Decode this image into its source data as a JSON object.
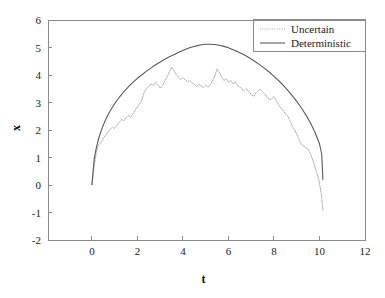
{
  "chart_data": {
    "type": "line",
    "title": "",
    "xlabel": "t",
    "ylabel": "x",
    "xlim": [
      -1.93,
      12
    ],
    "ylim": [
      -2,
      6
    ],
    "xticks": [
      0,
      2,
      4,
      6,
      8,
      10,
      12
    ],
    "xticklabels": [
      "0",
      "2",
      "4",
      "6",
      "8",
      "10",
      "12"
    ],
    "yticks": [
      -2,
      -1,
      0,
      1,
      2,
      3,
      4,
      5,
      6
    ],
    "yticklabels": [
      "-2",
      "-1",
      "0",
      "1",
      "2",
      "3",
      "4",
      "5",
      "6"
    ],
    "grid": false,
    "legend_position": "top-right",
    "series": [
      {
        "name": "Uncertain",
        "style": "dotted",
        "color": "#9a9a9a",
        "x": [
          0.0,
          0.1,
          0.2,
          0.3,
          0.4,
          0.5,
          0.6,
          0.7,
          0.8,
          0.9,
          1.0,
          1.1,
          1.2,
          1.3,
          1.4,
          1.5,
          1.6,
          1.7,
          1.8,
          1.9,
          2.0,
          2.1,
          2.2,
          2.3,
          2.4,
          2.5,
          2.6,
          2.7,
          2.8,
          2.9,
          3.0,
          3.1,
          3.2,
          3.3,
          3.4,
          3.5,
          3.6,
          3.7,
          3.8,
          3.9,
          4.0,
          4.1,
          4.2,
          4.3,
          4.4,
          4.5,
          4.6,
          4.7,
          4.8,
          4.9,
          5.0,
          5.1,
          5.2,
          5.3,
          5.4,
          5.5,
          5.6,
          5.7,
          5.8,
          5.9,
          6.0,
          6.1,
          6.2,
          6.3,
          6.4,
          6.5,
          6.6,
          6.7,
          6.8,
          6.9,
          7.0,
          7.1,
          7.2,
          7.3,
          7.4,
          7.5,
          7.6,
          7.7,
          7.8,
          7.9,
          8.0,
          8.1,
          8.2,
          8.3,
          8.4,
          8.5,
          8.6,
          8.7,
          8.8,
          8.9,
          9.0,
          9.1,
          9.2,
          9.3,
          9.4,
          9.5,
          9.6,
          9.7,
          9.8,
          9.9,
          10.0,
          10.1,
          10.15
        ],
        "y": [
          0.0,
          0.7,
          1.2,
          1.48,
          1.55,
          1.72,
          1.8,
          1.92,
          2.02,
          2.1,
          2.06,
          2.18,
          2.28,
          2.38,
          2.34,
          2.45,
          2.52,
          2.46,
          2.58,
          2.72,
          2.84,
          2.96,
          3.1,
          3.38,
          3.52,
          3.58,
          3.68,
          3.62,
          3.74,
          3.66,
          3.52,
          3.62,
          3.78,
          3.92,
          4.1,
          4.28,
          4.18,
          4.02,
          3.92,
          3.84,
          3.9,
          3.82,
          3.76,
          3.8,
          3.72,
          3.66,
          3.58,
          3.66,
          3.6,
          3.54,
          3.62,
          3.56,
          3.64,
          3.78,
          3.96,
          4.22,
          4.1,
          3.92,
          3.8,
          3.86,
          3.74,
          3.8,
          3.68,
          3.74,
          3.62,
          3.56,
          3.48,
          3.42,
          3.5,
          3.38,
          3.3,
          3.22,
          3.34,
          3.42,
          3.48,
          3.38,
          3.3,
          3.18,
          3.1,
          3.14,
          3.22,
          3.06,
          2.92,
          2.8,
          2.72,
          2.58,
          2.52,
          2.34,
          2.16,
          2.02,
          1.84,
          1.66,
          1.48,
          1.42,
          1.36,
          1.3,
          1.14,
          0.92,
          0.66,
          0.4,
          0.08,
          -0.46,
          -0.92
        ]
      },
      {
        "name": "Deterministic",
        "style": "solid",
        "color": "#5a5a5a",
        "x": [
          0.0,
          0.1,
          0.2,
          0.3,
          0.4,
          0.5,
          0.6,
          0.7,
          0.8,
          0.9,
          1.0,
          1.2,
          1.4,
          1.6,
          1.8,
          2.0,
          2.2,
          2.4,
          2.6,
          2.8,
          3.0,
          3.2,
          3.4,
          3.6,
          3.8,
          4.0,
          4.2,
          4.4,
          4.6,
          4.8,
          5.0,
          5.2,
          5.4,
          5.6,
          5.8,
          6.0,
          6.2,
          6.4,
          6.6,
          6.8,
          7.0,
          7.2,
          7.4,
          7.6,
          7.8,
          8.0,
          8.2,
          8.4,
          8.6,
          8.8,
          9.0,
          9.2,
          9.4,
          9.6,
          9.8,
          10.0,
          10.1,
          10.15
        ],
        "y": [
          0.02,
          0.95,
          1.38,
          1.7,
          1.96,
          2.18,
          2.37,
          2.54,
          2.69,
          2.83,
          2.96,
          3.19,
          3.39,
          3.57,
          3.73,
          3.88,
          4.01,
          4.14,
          4.26,
          4.37,
          4.47,
          4.57,
          4.66,
          4.74,
          4.82,
          4.89,
          4.96,
          5.02,
          5.06,
          5.1,
          5.12,
          5.12,
          5.11,
          5.08,
          5.04,
          4.99,
          4.92,
          4.85,
          4.77,
          4.68,
          4.58,
          4.47,
          4.36,
          4.23,
          4.1,
          3.95,
          3.8,
          3.63,
          3.45,
          3.25,
          3.04,
          2.81,
          2.55,
          2.26,
          1.92,
          1.5,
          1.1,
          0.2
        ]
      }
    ]
  },
  "legend": {
    "entries": [
      {
        "label": "Uncertain"
      },
      {
        "label": "Deterministic"
      }
    ]
  },
  "axes": {
    "x_title": "t",
    "y_title": "x"
  }
}
